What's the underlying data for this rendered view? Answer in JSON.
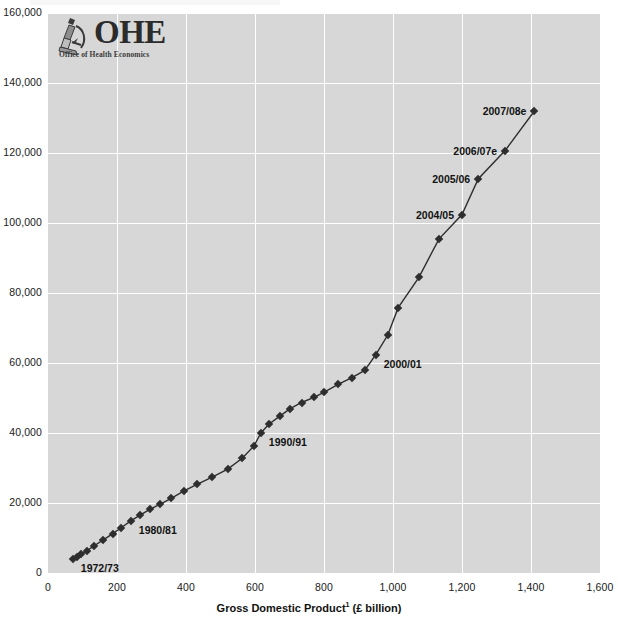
{
  "logo": {
    "wordmark": "OHE",
    "tagline": "Office of Health Economics",
    "icon": "microscope-icon"
  },
  "axes": {
    "x_title_main": "Gross Domestic Product",
    "x_title_sup": "1",
    "x_title_unit": " (£ billion)",
    "x_ticks": [
      "0",
      "200",
      "400",
      "600",
      "800",
      "1,000",
      "1,200",
      "1,400",
      "1,600"
    ],
    "y_ticks": [
      "0",
      "20,000",
      "40,000",
      "60,000",
      "80,000",
      "100,000",
      "120,000",
      "140,000",
      "160,000"
    ]
  },
  "colors": {
    "panel": "#d7d7d7",
    "grid": "#ffffff",
    "series": "#2e2e2e",
    "text": "#1a1a1a"
  },
  "chart_data": {
    "type": "line",
    "title": "",
    "xlabel": "Gross Domestic Product¹ (£ billion)",
    "ylabel": "",
    "xlim": [
      0,
      1600
    ],
    "ylim": [
      0,
      160000
    ],
    "xticks": [
      0,
      200,
      400,
      600,
      800,
      1000,
      1200,
      1400,
      1600
    ],
    "yticks": [
      0,
      20000,
      40000,
      60000,
      80000,
      100000,
      120000,
      140000,
      160000
    ],
    "grid": true,
    "legend": "none",
    "marker": "diamond",
    "series": [
      {
        "name": "Total health expenditure vs GDP",
        "points": [
          {
            "label": "1972/73",
            "x": 72,
            "y": 3900
          },
          {
            "label": "",
            "x": 84,
            "y": 4600
          },
          {
            "label": "",
            "x": 97,
            "y": 5400
          },
          {
            "label": "",
            "x": 113,
            "y": 6400
          },
          {
            "label": "",
            "x": 133,
            "y": 7700
          },
          {
            "label": "",
            "x": 159,
            "y": 9400
          },
          {
            "label": "",
            "x": 187,
            "y": 11200
          },
          {
            "label": "",
            "x": 213,
            "y": 13000
          },
          {
            "label": "1980/81",
            "x": 240,
            "y": 14900
          },
          {
            "label": "",
            "x": 268,
            "y": 16600
          },
          {
            "label": "",
            "x": 295,
            "y": 18200
          },
          {
            "label": "",
            "x": 324,
            "y": 19600
          },
          {
            "label": "",
            "x": 357,
            "y": 21300
          },
          {
            "label": "",
            "x": 393,
            "y": 23400
          },
          {
            "label": "",
            "x": 432,
            "y": 25300
          },
          {
            "label": "",
            "x": 476,
            "y": 27400
          },
          {
            "label": "",
            "x": 521,
            "y": 29700
          },
          {
            "label": "",
            "x": 563,
            "y": 32800
          },
          {
            "label": "",
            "x": 597,
            "y": 36300
          },
          {
            "label": "1990/91",
            "x": 617,
            "y": 40000
          },
          {
            "label": "",
            "x": 640,
            "y": 42500
          },
          {
            "label": "",
            "x": 673,
            "y": 44900
          },
          {
            "label": "",
            "x": 701,
            "y": 46900
          },
          {
            "label": "",
            "x": 735,
            "y": 48700
          },
          {
            "label": "",
            "x": 771,
            "y": 50200
          },
          {
            "label": "",
            "x": 801,
            "y": 51700
          },
          {
            "label": "",
            "x": 841,
            "y": 53900
          },
          {
            "label": "",
            "x": 881,
            "y": 55800
          },
          {
            "label": "",
            "x": 918,
            "y": 57900
          },
          {
            "label": "2000/01",
            "x": 950,
            "y": 62400
          },
          {
            "label": "",
            "x": 985,
            "y": 68000
          },
          {
            "label": "",
            "x": 1015,
            "y": 75800
          },
          {
            "label": "",
            "x": 1075,
            "y": 84500
          },
          {
            "label": "",
            "x": 1133,
            "y": 95400
          },
          {
            "label": "2004/05",
            "x": 1200,
            "y": 102400
          },
          {
            "label": "2005/06",
            "x": 1247,
            "y": 112600
          },
          {
            "label": "2006/07e",
            "x": 1325,
            "y": 120700
          },
          {
            "label": "2007/08e",
            "x": 1410,
            "y": 132000
          }
        ]
      }
    ],
    "annotations": [
      {
        "text": "1972/73",
        "x": 72,
        "y": 3900,
        "side": "right"
      },
      {
        "text": "1980/81",
        "x": 240,
        "y": 14900,
        "side": "right"
      },
      {
        "text": "1990/91",
        "x": 617,
        "y": 40000,
        "side": "right"
      },
      {
        "text": "2000/01",
        "x": 950,
        "y": 62400,
        "side": "right"
      },
      {
        "text": "2004/05",
        "x": 1200,
        "y": 102400,
        "side": "left"
      },
      {
        "text": "2005/06",
        "x": 1247,
        "y": 112600,
        "side": "left"
      },
      {
        "text": "2006/07e",
        "x": 1325,
        "y": 120700,
        "side": "left"
      },
      {
        "text": "2007/08e",
        "x": 1410,
        "y": 132000,
        "side": "left"
      }
    ]
  }
}
